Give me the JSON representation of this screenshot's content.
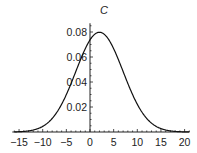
{
  "chart_data": {
    "type": "line",
    "title": "C",
    "xlabel": "",
    "ylabel": "",
    "xlim": [
      -16,
      21
    ],
    "ylim": [
      0,
      0.087
    ],
    "x_ticks": [
      -15,
      -10,
      -5,
      0,
      5,
      10,
      15,
      20
    ],
    "x_tick_labels": [
      "−15",
      "−10",
      "−5",
      "0",
      "5",
      "10",
      "15",
      "20"
    ],
    "y_ticks": [
      0.02,
      0.04,
      0.06,
      0.08
    ],
    "y_tick_labels": [
      "0.02",
      "0.04",
      "0.06",
      "0.08"
    ],
    "grid": false,
    "legend": null,
    "series": [
      {
        "name": "C",
        "description": "Normal density, mean ≈ 2, sd ≈ 5",
        "x": [
          -16,
          -14,
          -12,
          -10,
          -8,
          -6,
          -4,
          -2,
          0,
          2,
          4,
          6,
          8,
          10,
          12,
          14,
          16,
          18,
          20
        ],
        "values": [
          0.0004,
          0.0013,
          0.0036,
          0.0089,
          0.0108,
          0.0222,
          0.0389,
          0.0579,
          0.0737,
          0.0798,
          0.0737,
          0.0579,
          0.0389,
          0.0222,
          0.0108,
          0.0045,
          0.0016,
          0.0005,
          0.0001
        ]
      }
    ],
    "curve_params": {
      "mean": 2,
      "sd": 5
    }
  }
}
